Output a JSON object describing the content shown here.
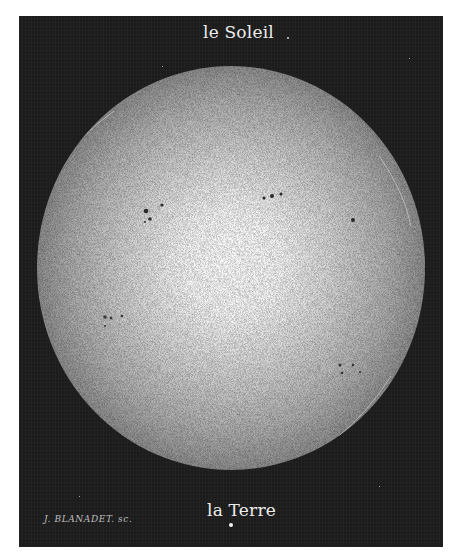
{
  "illustration": {
    "title_top": "le Soleil",
    "title_bottom": "la Terre",
    "signature": "J. BLANADET. sc.",
    "colors": {
      "background_page": "#ffffff",
      "plate": "#1c1c1c",
      "sun_center": "#ffffff",
      "sun_edge": "#8e8e8e",
      "text": "#ececec",
      "sunspot": "#2a2a2a"
    },
    "elements": {
      "sun": "large stippled solar disk with limb darkening",
      "earth": "small white dot representing Earth to scale",
      "sunspots": "several sunspot groups scattered across the disk"
    }
  }
}
